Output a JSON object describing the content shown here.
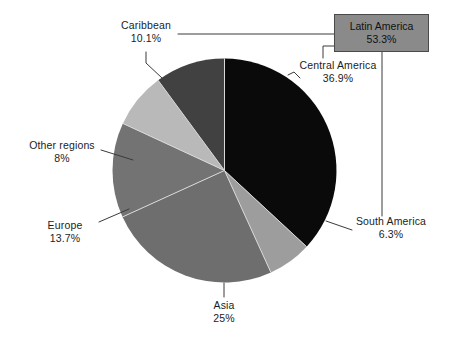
{
  "chart_data": {
    "type": "pie",
    "title": "",
    "subtitle": "",
    "xlabel": "",
    "ylabel": "",
    "legend_position": "callout-labels",
    "grid": false,
    "total_label": "Latin America",
    "total_value": "53.3%",
    "categories": [
      "Central America",
      "South America",
      "Asia",
      "Europe",
      "Other regions",
      "Caribbean"
    ],
    "values": [
      36.9,
      6.3,
      25.0,
      13.7,
      8.0,
      10.1
    ],
    "slices": [
      {
        "label": "Central America",
        "value": 36.9,
        "value_text": "36.9%",
        "color": "#0a0a0a",
        "start_angle": 0,
        "end_angle": 132.84
      },
      {
        "label": "South America",
        "value": 6.3,
        "value_text": "6.3%",
        "color": "#9d9d9d",
        "start_angle": 132.84,
        "end_angle": 155.52
      },
      {
        "label": "Asia",
        "value": 25.0,
        "value_text": "25%",
        "color": "#6e6e6e",
        "start_angle": 155.52,
        "end_angle": 245.52
      },
      {
        "label": "Europe",
        "value": 13.7,
        "value_text": "13.7%",
        "color": "#737373",
        "start_angle": 245.52,
        "end_angle": 294.84
      },
      {
        "label": "Other regions",
        "value": 8.0,
        "value_text": "8%",
        "color": "#b9b9b9",
        "start_angle": 294.84,
        "end_angle": 323.64
      },
      {
        "label": "Caribbean",
        "value": 10.1,
        "value_text": "10.1%",
        "color": "#414141",
        "start_angle": 323.64,
        "end_angle": 360
      }
    ]
  },
  "labels": {
    "caribbean": {
      "name": "Caribbean",
      "value": "10.1%"
    },
    "central_america": {
      "name": "Central America",
      "value": "36.9%"
    },
    "other_regions": {
      "name": "Other regions",
      "value": "8%"
    },
    "europe": {
      "name": "Europe",
      "value": "13.7%"
    },
    "asia": {
      "name": "Asia",
      "value": "25%"
    },
    "south_america": {
      "name": "South America",
      "value": "6.3%"
    },
    "latin_america": {
      "name": "Latin America",
      "value": "53.3%"
    }
  },
  "colors": {
    "central_america": "#0a0a0a",
    "south_america": "#9d9d9d",
    "asia": "#6e6e6e",
    "europe": "#737373",
    "other_regions": "#b9b9b9",
    "caribbean": "#414141",
    "latin_box_fill": "#8a8a8a",
    "leader_line": "#3a3a3a",
    "background": "#ffffff"
  }
}
